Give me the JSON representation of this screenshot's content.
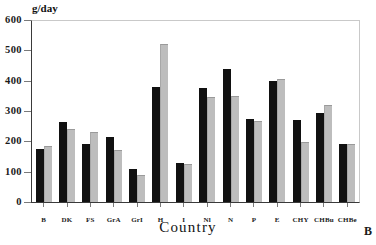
{
  "figure": {
    "panel_letter": "B",
    "y_unit_label": "g/day"
  },
  "chart_data": {
    "type": "bar",
    "title": "",
    "xlabel": "Country",
    "ylabel": "g/day",
    "ylim": [
      0,
      600
    ],
    "yticks": [
      0,
      100,
      200,
      300,
      400,
      500,
      600
    ],
    "ytick_labels": [
      "0",
      "100",
      "200",
      "300",
      "400",
      "500",
      "600"
    ],
    "grid": false,
    "legend": null,
    "categories": [
      "B",
      "DK",
      "FS",
      "GrA",
      "GrI",
      "H",
      "I",
      "Nl",
      "N",
      "P",
      "E",
      "CHY",
      "CHBu",
      "CHBe"
    ],
    "series": [
      {
        "name": "series-1",
        "color": "#111111",
        "values": [
          175,
          265,
          190,
          215,
          110,
          380,
          130,
          375,
          440,
          275,
          400,
          270,
          295,
          190
        ]
      },
      {
        "name": "series-2",
        "color": "#bdbdbd",
        "values": [
          185,
          240,
          230,
          172,
          90,
          520,
          125,
          345,
          350,
          268,
          405,
          198,
          320,
          190
        ]
      }
    ]
  }
}
